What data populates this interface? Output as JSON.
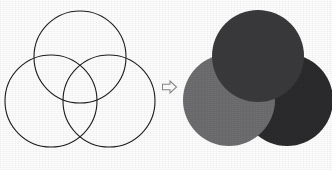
{
  "figure": {
    "background_color": "#fefefe",
    "width": 332,
    "height": 170
  },
  "left_panel": {
    "name": "outlined-venn-diagram",
    "description": "Three overlapping circles drawn as thin black outlines",
    "stroke_color": "#1c1c1c",
    "stroke_width": 1.1,
    "fill": "none",
    "circles": [
      {
        "label": "top",
        "cx": 80,
        "cy": 57,
        "r": 46
      },
      {
        "label": "bottom-left",
        "cx": 51,
        "cy": 101,
        "r": 46
      },
      {
        "label": "bottom-right",
        "cx": 109,
        "cy": 101,
        "r": 46
      }
    ]
  },
  "arrow": {
    "name": "rightwards-arrow",
    "glyph": "⇨",
    "direction": "right",
    "fill_color": "#ffffff",
    "stroke_color": "#8a8a8a"
  },
  "right_panel": {
    "name": "filled-venn-diagram",
    "description": "Three opaque overlapping discs stacked with hard edges",
    "circles": [
      {
        "label": "bottom-right",
        "cx": 107,
        "cy": 100,
        "r": 46,
        "color": "#2b2b2d",
        "z": 1
      },
      {
        "label": "bottom-left",
        "cx": 49,
        "cy": 100,
        "r": 46,
        "color": "#6e6e70",
        "z": 2
      },
      {
        "label": "top",
        "cx": 78,
        "cy": 56,
        "r": 46,
        "color": "#3a3a3c",
        "z": 3
      }
    ]
  }
}
